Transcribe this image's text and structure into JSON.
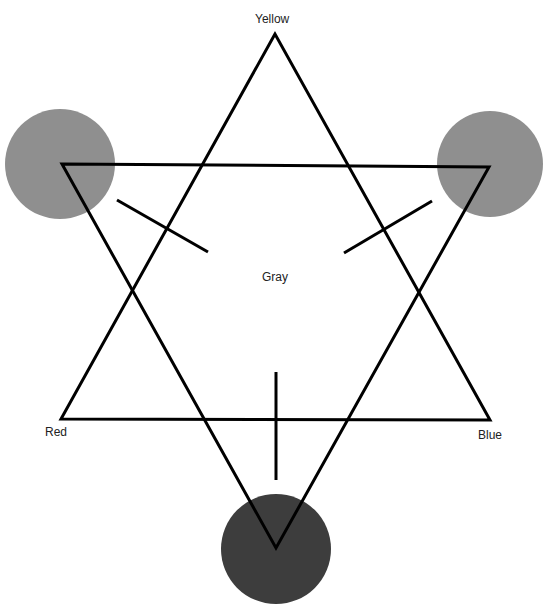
{
  "diagram": {
    "type": "color-star",
    "labels": {
      "top": "Yellow",
      "left": "Red",
      "right": "Blue",
      "center": "Gray"
    },
    "colors": {
      "line": "#000000",
      "circle_light": "#8f8f8f",
      "circle_dark": "#3d3d3d",
      "background": "#ffffff"
    },
    "triangles": [
      {
        "name": "upward",
        "points": [
          [
            275,
            34
          ],
          [
            61,
            419
          ],
          [
            490,
            420
          ]
        ]
      },
      {
        "name": "downward",
        "points": [
          [
            62,
            164
          ],
          [
            489,
            167
          ],
          [
            276,
            548
          ]
        ]
      }
    ],
    "circles": [
      {
        "name": "upper-left",
        "cx": 60,
        "cy": 164,
        "r": 55,
        "shade": "light"
      },
      {
        "name": "upper-right",
        "cx": 490,
        "cy": 164,
        "r": 53,
        "shade": "light"
      },
      {
        "name": "bottom",
        "cx": 276,
        "cy": 549,
        "r": 55,
        "shade": "dark"
      }
    ]
  }
}
